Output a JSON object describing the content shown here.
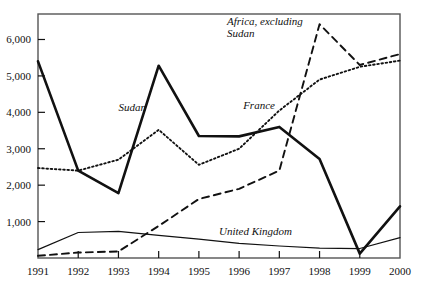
{
  "chart_data": {
    "type": "line",
    "title": "",
    "xlabel": "",
    "ylabel": "",
    "x": [
      1991,
      1992,
      1993,
      1994,
      1995,
      1996,
      1997,
      1998,
      1999,
      2000
    ],
    "xtick_labels": [
      "1991",
      "1992",
      "1993",
      "1994",
      "1995",
      "1996",
      "1997",
      "1998",
      "1999",
      "2000"
    ],
    "ytick_values": [
      1000,
      2000,
      3000,
      4000,
      5000,
      6000
    ],
    "ytick_labels": [
      "1,000",
      "2,000",
      "3,000",
      "4,000",
      "5,000",
      "6,000"
    ],
    "ylim": [
      0,
      6700
    ],
    "xlim": [
      1991,
      2000
    ],
    "grid": false,
    "legend": "inline-annotations",
    "series": [
      {
        "name": "Sudan",
        "style": "solid-thick",
        "label_x": 1993.0,
        "label_y": 4050,
        "values": [
          5400,
          2400,
          1780,
          5280,
          3350,
          3340,
          3600,
          2720,
          120,
          1420
        ]
      },
      {
        "name": "France",
        "style": "dotted",
        "label_x": 1996.1,
        "label_y": 4100,
        "values": [
          2470,
          2400,
          2700,
          3520,
          2560,
          3000,
          4050,
          4900,
          5250,
          5420
        ]
      },
      {
        "name": "Africa, excluding Sudan",
        "style": "dashed",
        "label_x": 1995.7,
        "label_y": 6400,
        "label_line2": "Sudan",
        "values": [
          60,
          150,
          180,
          880,
          1620,
          1900,
          2400,
          6420,
          5300,
          5600
        ]
      },
      {
        "name": "United Kingdom",
        "style": "solid-thin",
        "label_x": 1995.5,
        "label_y": 620,
        "values": [
          230,
          700,
          730,
          620,
          520,
          400,
          330,
          270,
          260,
          560
        ]
      }
    ]
  },
  "annotations": {
    "africa_label_line1": "Africa, excluding",
    "africa_label_line2": "Sudan",
    "sudan_label": "Sudan",
    "france_label": "France",
    "uk_label": "United Kingdom"
  },
  "colors": {
    "ink": "#111111",
    "frame": "#555555",
    "background": "#ffffff"
  }
}
